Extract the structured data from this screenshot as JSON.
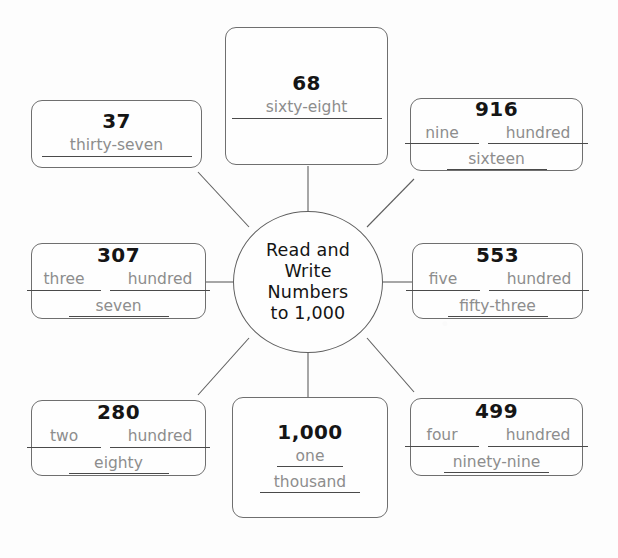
{
  "center": {
    "title_lines": [
      "Read and",
      "Write",
      "Numbers",
      "to 1,000"
    ],
    "title_text": "Read and Write Numbers to 1,000"
  },
  "style": {
    "box_border_color": "#6f6f6f",
    "numeral_color": "#151515",
    "answer_text_color": "#8d8d8d",
    "blank_line_color": "#4a4a4a",
    "background_color": "#fdfdfd"
  },
  "nodes": [
    {
      "id": "node-68",
      "numeral": "68",
      "layout": "single",
      "rows": [
        [
          {
            "text": "sixty-eight",
            "width": "wide"
          }
        ]
      ]
    },
    {
      "id": "node-916",
      "numeral": "916",
      "layout": "split",
      "rows": [
        [
          {
            "text": "nine",
            "width": "half"
          },
          {
            "text": "hundred",
            "width": "mid"
          }
        ],
        [
          {
            "text": "sixteen",
            "width": "mid"
          }
        ]
      ]
    },
    {
      "id": "node-37",
      "numeral": "37",
      "layout": "single",
      "rows": [
        [
          {
            "text": "thirty-seven",
            "width": "wide"
          }
        ]
      ]
    },
    {
      "id": "node-307",
      "numeral": "307",
      "layout": "split",
      "rows": [
        [
          {
            "text": "three",
            "width": "half"
          },
          {
            "text": "hundred",
            "width": "mid"
          }
        ],
        [
          {
            "text": "seven",
            "width": "mid"
          }
        ]
      ]
    },
    {
      "id": "node-553",
      "numeral": "553",
      "layout": "split",
      "rows": [
        [
          {
            "text": "five",
            "width": "half"
          },
          {
            "text": "hundred",
            "width": "mid"
          }
        ],
        [
          {
            "text": "fifty-three",
            "width": "mid"
          }
        ]
      ]
    },
    {
      "id": "node-280",
      "numeral": "280",
      "layout": "split",
      "rows": [
        [
          {
            "text": "two",
            "width": "half"
          },
          {
            "text": "hundred",
            "width": "mid"
          }
        ],
        [
          {
            "text": "eighty",
            "width": "mid"
          }
        ]
      ]
    },
    {
      "id": "node-499",
      "numeral": "499",
      "layout": "split",
      "rows": [
        [
          {
            "text": "four",
            "width": "half"
          },
          {
            "text": "hundred",
            "width": "mid"
          }
        ],
        [
          {
            "text": "ninety-nine",
            "width": "mid"
          }
        ]
      ]
    },
    {
      "id": "node-1000",
      "numeral": "1,000",
      "layout": "stacked",
      "rows": [
        [
          {
            "text": "one",
            "width": "narrow"
          }
        ],
        [
          {
            "text": "thousand",
            "width": "mid"
          }
        ]
      ]
    }
  ]
}
